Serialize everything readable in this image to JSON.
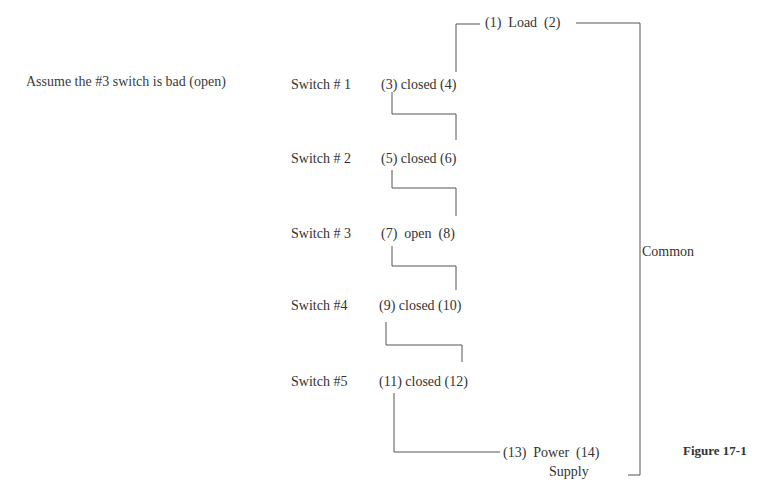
{
  "note": "Assume the #3 switch is bad (open)",
  "load": {
    "label": "(1)  Load  (2)"
  },
  "switches": [
    {
      "name": "Switch # 1",
      "state": "(3) closed (4)"
    },
    {
      "name": "Switch # 2",
      "state": "(5) closed (6)"
    },
    {
      "name": "Switch # 3",
      "state": "(7)  open  (8)"
    },
    {
      "name": "Switch #4",
      "state": "(9) closed (10)"
    },
    {
      "name": "Switch #5",
      "state": "(11) closed (12)"
    }
  ],
  "power_supply": {
    "label": "(13)  Power  (14)",
    "sublabel": "Supply"
  },
  "common_label": "Common",
  "figure_caption": "Figure 17-1"
}
